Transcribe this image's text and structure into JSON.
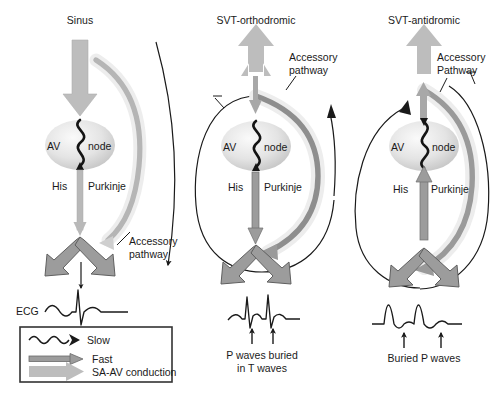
{
  "figure": {
    "type": "medical-diagram",
    "panel_count": 3
  },
  "panels": [
    {
      "id": "sinus",
      "title": "Sinus",
      "node_left": "AV",
      "node_right": "node",
      "bundle_left": "His",
      "bundle_right": "Purkinje",
      "accessory_label_line1": "Accessory",
      "accessory_label_line2": "pathway",
      "ecg_label": "ECG",
      "ecg_description": "normal sinus beat: P wave, narrow QRS, T wave",
      "conduction": "antegrade down AV node, dormant accessory pathway"
    },
    {
      "id": "svt-orthodromic",
      "title": "SVT-orthodromic",
      "node_left": "AV",
      "node_right": "node",
      "bundle_left": "His",
      "bundle_right": "Purkinje",
      "accessory_label_line1": "Accessory",
      "accessory_label_line2": "pathway",
      "ecg_caption_line1": "P waves buried",
      "ecg_caption_line2": "in T waves",
      "ecg_description": "narrow complex tachycardia, two beats, retrograde P waves marked by arrows",
      "conduction": "antegrade AV node, retrograde accessory pathway"
    },
    {
      "id": "svt-antidromic",
      "title": "SVT-antidromic",
      "node_left": "AV",
      "node_right": "node",
      "bundle_left": "His",
      "bundle_right": "Purkinje",
      "accessory_label_line1": "Accessory",
      "accessory_label_line2": "Pathway",
      "ecg_caption_line1": "Buried P waves",
      "ecg_description": "wide complex tachycardia, two broad beats, buried P waves marked by arrows",
      "conduction": "antegrade accessory pathway, retrograde AV node"
    }
  ],
  "legend": {
    "items": [
      {
        "key": "slow",
        "label": "Slow",
        "symbol": "wavy-arrow"
      },
      {
        "key": "fast",
        "label": "Fast",
        "symbol": "thin-arrow"
      },
      {
        "key": "sa-av",
        "label": "SA-AV conduction",
        "symbol": "thick-arrow"
      }
    ]
  },
  "colors": {
    "ink": "#1a1a1a",
    "thick_arrow": "#b9b9b9",
    "medium_arrow": "#8a8a8a",
    "arrow_outline": "#6a6a6a",
    "accessory_arc": "#9a9a9a",
    "accessory_halo": "#e2e2e2",
    "node_fill_center": "#f2f2f2",
    "node_fill_edge": "#c6c6c6",
    "legend_border": "#333333"
  }
}
